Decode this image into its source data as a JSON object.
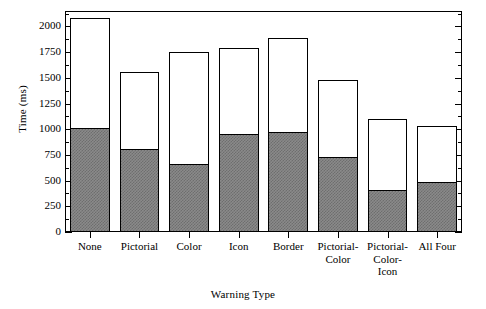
{
  "chart_data": {
    "type": "bar",
    "title": "",
    "subtitle": "",
    "xlabel": "Warning Type",
    "ylabel": "Time (ms)",
    "categories": [
      "None",
      "Pictorial",
      "Color",
      "Icon",
      "Border",
      "Pictorial-\nColor",
      "Pictorial-\nColor-\nIcon",
      "All Four"
    ],
    "series": [
      {
        "name": "lower-segment",
        "style": "hatched-gray",
        "values": [
          1000,
          800,
          650,
          940,
          960,
          720,
          400,
          480
        ]
      },
      {
        "name": "total",
        "style": "white",
        "values": [
          2080,
          1560,
          1750,
          1790,
          1890,
          1480,
          1100,
          1030
        ]
      }
    ],
    "values": [
      2080,
      1560,
      1750,
      1790,
      1890,
      1480,
      1100,
      1030
    ],
    "ylim": [
      0,
      2150
    ],
    "ytick_labels": [
      "0",
      "250",
      "500",
      "750",
      "1000",
      "1250",
      "1500",
      "1750",
      "2000"
    ],
    "ytick_values": [
      0,
      250,
      500,
      750,
      1000,
      1250,
      1500,
      1750,
      2000
    ],
    "yminor_interval": 125,
    "grid": false,
    "legend": "none",
    "frame": "box",
    "colors": {
      "bar_fill": "#ffffff",
      "bar_edge": "#000000",
      "segment_fill": "#8a8a8a",
      "background": "#ffffff",
      "text": "#000000"
    }
  }
}
